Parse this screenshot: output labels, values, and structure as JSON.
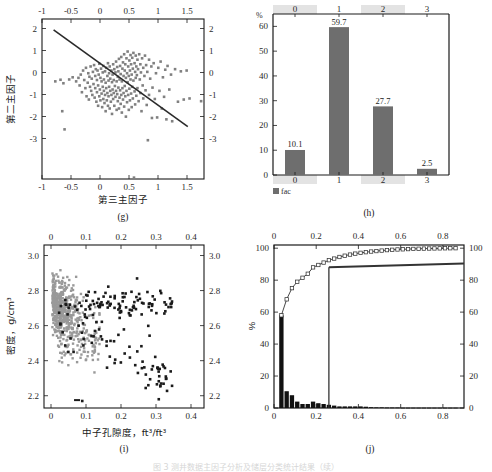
{
  "figure": {
    "bottom_caption": "图 3 测井数据主因子分析及储层分类统计结果（续）"
  },
  "panels": {
    "g": {
      "label": "(g)",
      "xlabel": "第三主因子",
      "ylabel": "第二主因子",
      "xticks": [
        "-1",
        "-0.5",
        "0",
        "0.5",
        "1",
        "1.5"
      ],
      "yticks": [
        "2",
        "1",
        "0",
        "-1",
        "-2",
        "-3"
      ],
      "point_color": "#808080",
      "line_color": "#2a2a2a"
    },
    "h": {
      "label": "(h)",
      "ylabel": "%",
      "legend": "fac",
      "bar_color": "#6e6e6e",
      "xticks": [
        "0",
        "1",
        "2",
        "3"
      ],
      "yticks": [
        "0",
        "10",
        "20",
        "30",
        "40",
        "50",
        "60"
      ],
      "top_xticks": [
        "0",
        "1",
        "2",
        "3"
      ]
    },
    "i": {
      "label": "(i)",
      "xlabel": "中子孔隙度，ft³/ft³",
      "ylabel": "密度，g/cm³",
      "xticks": [
        "0",
        "0.1",
        "0.2",
        "0.3",
        "0.4"
      ],
      "yticks": [
        "2.2",
        "2.4",
        "2.6",
        "2.8",
        "3.0"
      ],
      "color_a": "#999999",
      "color_b": "#1a1a1a"
    },
    "j": {
      "label": "(j)",
      "ylabel": "%",
      "xticks": [
        "0",
        "0.2",
        "0.4",
        "0.6",
        "0.8"
      ],
      "yticks": [
        "0",
        "20",
        "40",
        "60",
        "80",
        "100"
      ],
      "right_yticks": [
        "0",
        "20",
        "40",
        "60",
        "80",
        "100"
      ],
      "bar_color": "#111111",
      "line_color": "#333333",
      "cutoff_color": "#2a2a2a"
    }
  },
  "chart_data": [
    {
      "type": "scatter",
      "id": "g",
      "title": "(g)",
      "xlabel": "第三主因子",
      "ylabel": "第二主因子",
      "xlim": [
        -1.25,
        1.55
      ],
      "ylim": [
        -3.55,
        2.35
      ],
      "xticks": [
        -1,
        -0.5,
        0,
        0.5,
        1,
        1.5
      ],
      "yticks": [
        2,
        1,
        0,
        -1,
        -2,
        -3
      ],
      "grid": false,
      "marker": "square",
      "marker_color": "#808080",
      "trendline": {
        "x": [
          -1.05,
          1.27
        ],
        "y": [
          1.95,
          -1.62
        ],
        "color": "#2a2a2a"
      },
      "points": [
        [
          -1.02,
          0.05
        ],
        [
          -0.93,
          0.11
        ],
        [
          -0.88,
          -0.02
        ],
        [
          -0.9,
          -1.05
        ],
        [
          -0.86,
          -1.72
        ],
        [
          -0.78,
          0.12
        ],
        [
          -0.72,
          0.2
        ],
        [
          -0.66,
          0.05
        ],
        [
          -0.62,
          0.18
        ],
        [
          -0.6,
          -0.1
        ],
        [
          -0.58,
          0.3
        ],
        [
          -0.56,
          -0.35
        ],
        [
          -0.54,
          0.45
        ],
        [
          -0.52,
          0.1
        ],
        [
          -0.5,
          -0.2
        ],
        [
          -0.49,
          0.55
        ],
        [
          -0.48,
          -0.5
        ],
        [
          -0.46,
          0.0
        ],
        [
          -0.45,
          0.35
        ],
        [
          -0.44,
          -0.62
        ],
        [
          -0.43,
          0.22
        ],
        [
          -0.42,
          -0.15
        ],
        [
          -0.41,
          0.6
        ],
        [
          -0.4,
          -0.3
        ],
        [
          -0.39,
          0.15
        ],
        [
          -0.38,
          -0.45
        ],
        [
          -0.37,
          0.4
        ],
        [
          -0.36,
          -0.05
        ],
        [
          -0.35,
          0.65
        ],
        [
          -0.34,
          -0.55
        ],
        [
          -0.33,
          0.25
        ],
        [
          -0.33,
          -0.2
        ],
        [
          -0.32,
          0.5
        ],
        [
          -0.31,
          -0.7
        ],
        [
          -0.3,
          0.1
        ],
        [
          -0.3,
          -0.35
        ],
        [
          -0.29,
          0.45
        ],
        [
          -0.28,
          -0.1
        ],
        [
          -0.28,
          -0.85
        ],
        [
          -0.27,
          0.3
        ],
        [
          -0.26,
          -0.5
        ],
        [
          -0.26,
          0.7
        ],
        [
          -0.25,
          -0.25
        ],
        [
          -0.24,
          0.18
        ],
        [
          -0.24,
          -0.65
        ],
        [
          -0.23,
          0.52
        ],
        [
          -0.22,
          -0.4
        ],
        [
          -0.22,
          0.05
        ],
        [
          -0.21,
          -0.9
        ],
        [
          -0.2,
          0.38
        ],
        [
          -0.2,
          -0.15
        ],
        [
          -0.19,
          -0.6
        ],
        [
          -0.19,
          0.62
        ],
        [
          -0.18,
          -0.3
        ],
        [
          -0.18,
          0.12
        ],
        [
          -0.17,
          -0.75
        ],
        [
          -0.16,
          0.42
        ],
        [
          -0.16,
          -0.45
        ],
        [
          -0.15,
          0.0
        ],
        [
          -0.15,
          -1.05
        ],
        [
          -0.14,
          0.55
        ],
        [
          -0.14,
          -0.2
        ],
        [
          -0.13,
          -0.65
        ],
        [
          -0.12,
          0.25
        ],
        [
          -0.12,
          -0.38
        ],
        [
          -0.11,
          0.72
        ],
        [
          -0.11,
          -0.85
        ],
        [
          -0.1,
          0.08
        ],
        [
          -0.1,
          -0.5
        ],
        [
          -0.09,
          0.35
        ],
        [
          -0.09,
          -0.15
        ],
        [
          -0.08,
          -0.95
        ],
        [
          -0.08,
          0.6
        ],
        [
          -0.07,
          -0.3
        ],
        [
          -0.07,
          0.15
        ],
        [
          -0.06,
          -0.7
        ],
        [
          -0.05,
          0.45
        ],
        [
          -0.05,
          -0.45
        ],
        [
          -0.04,
          0.02
        ],
        [
          -0.04,
          -1.15
        ],
        [
          -0.03,
          0.3
        ],
        [
          -0.03,
          -0.25
        ],
        [
          -0.02,
          0.68
        ],
        [
          -0.02,
          -0.6
        ],
        [
          -0.01,
          0.1
        ],
        [
          -0.01,
          -0.38
        ],
        [
          0,
          0.5
        ],
        [
          0,
          -0.85
        ],
        [
          0.01,
          -0.12
        ],
        [
          0.02,
          0.38
        ],
        [
          0.02,
          -0.52
        ],
        [
          0.03,
          0.78
        ],
        [
          0.03,
          -0.3
        ],
        [
          0.04,
          0.05
        ],
        [
          0.04,
          -1.0
        ],
        [
          0.05,
          0.58
        ],
        [
          0.05,
          -0.42
        ],
        [
          0.06,
          0.22
        ],
        [
          0.06,
          -0.68
        ],
        [
          0.07,
          0.42
        ],
        [
          0.07,
          -0.18
        ],
        [
          0.08,
          0.88
        ],
        [
          0.08,
          -0.95
        ],
        [
          0.09,
          0.12
        ],
        [
          0.09,
          -0.55
        ],
        [
          0.1,
          0.62
        ],
        [
          0.1,
          -0.28
        ],
        [
          0.11,
          0.32
        ],
        [
          0.11,
          -0.78
        ],
        [
          0.12,
          0.95
        ],
        [
          0.12,
          -0.45
        ],
        [
          0.13,
          0.05
        ],
        [
          0.13,
          -1.1
        ],
        [
          0.14,
          0.52
        ],
        [
          0.14,
          -0.2
        ],
        [
          0.15,
          0.75
        ],
        [
          0.15,
          -0.62
        ],
        [
          0.16,
          0.25
        ],
        [
          0.16,
          -0.38
        ],
        [
          0.17,
          1.05
        ],
        [
          0.17,
          -0.88
        ],
        [
          0.18,
          0.45
        ],
        [
          0.18,
          -0.12
        ],
        [
          0.19,
          0.68
        ],
        [
          0.19,
          -0.5
        ],
        [
          0.2,
          0.18
        ],
        [
          0.2,
          -1.25
        ],
        [
          0.21,
          0.9
        ],
        [
          0.21,
          -0.3
        ],
        [
          0.22,
          0.35
        ],
        [
          0.22,
          -0.72
        ],
        [
          0.23,
          1.15
        ],
        [
          0.23,
          0.02
        ],
        [
          0.24,
          0.6
        ],
        [
          0.24,
          -0.45
        ],
        [
          0.25,
          0.25
        ],
        [
          0.25,
          -1.0
        ],
        [
          0.26,
          0.82
        ],
        [
          0.26,
          -0.22
        ],
        [
          0.27,
          0.45
        ],
        [
          0.27,
          -0.65
        ],
        [
          0.28,
          1.02
        ],
        [
          0.28,
          0.12
        ],
        [
          0.29,
          0.68
        ],
        [
          0.29,
          -0.4
        ],
        [
          0.3,
          0.3
        ],
        [
          0.3,
          -0.9
        ],
        [
          0.31,
          0.92
        ],
        [
          0.31,
          -0.15
        ],
        [
          0.32,
          0.52
        ],
        [
          0.32,
          -0.58
        ],
        [
          0.33,
          1.1
        ],
        [
          0.33,
          0.08
        ],
        [
          0.34,
          -3.5
        ],
        [
          0.35,
          0.72
        ],
        [
          0.35,
          -0.32
        ],
        [
          0.36,
          0.4
        ],
        [
          0.36,
          -0.8
        ],
        [
          0.37,
          1.0
        ],
        [
          0.37,
          0.18
        ],
        [
          0.38,
          0.6
        ],
        [
          0.38,
          -0.48
        ],
        [
          0.39,
          0.28
        ],
        [
          0.4,
          0.85
        ],
        [
          0.4,
          -0.2
        ],
        [
          0.41,
          0.5
        ],
        [
          0.42,
          -0.68
        ],
        [
          0.43,
          1.05
        ],
        [
          0.44,
          0.12
        ],
        [
          0.45,
          0.68
        ],
        [
          0.45,
          -0.38
        ],
        [
          0.46,
          0.38
        ],
        [
          0.47,
          -1.05
        ],
        [
          0.48,
          0.9
        ],
        [
          0.49,
          -0.1
        ],
        [
          0.5,
          0.55
        ],
        [
          0.5,
          -0.58
        ],
        [
          0.52,
          0.25
        ],
        [
          0.53,
          1.0
        ],
        [
          0.54,
          -0.28
        ],
        [
          0.55,
          0.65
        ],
        [
          0.56,
          -0.82
        ],
        [
          0.57,
          0.4
        ],
        [
          0.58,
          -2.12
        ],
        [
          0.6,
          0.85
        ],
        [
          0.6,
          -0.45
        ],
        [
          0.62,
          0.15
        ],
        [
          0.64,
          0.6
        ],
        [
          0.65,
          -1.3
        ],
        [
          0.66,
          -0.18
        ],
        [
          0.68,
          0.72
        ],
        [
          0.7,
          -0.6
        ],
        [
          0.72,
          0.35
        ],
        [
          0.74,
          -1.28
        ],
        [
          0.76,
          0.55
        ],
        [
          0.78,
          -0.3
        ],
        [
          0.8,
          0.78
        ],
        [
          0.82,
          -0.95
        ],
        [
          0.84,
          0.2
        ],
        [
          0.86,
          -0.52
        ],
        [
          0.88,
          0.48
        ],
        [
          0.9,
          -1.35
        ],
        [
          0.92,
          0.62
        ],
        [
          0.95,
          -0.25
        ],
        [
          0.98,
          0.3
        ],
        [
          1.0,
          -1.42
        ],
        [
          1.05,
          0.5
        ],
        [
          1.1,
          -0.7
        ],
        [
          1.15,
          0.42
        ],
        [
          1.2,
          -0.62
        ],
        [
          1.25,
          0.45
        ],
        [
          1.3,
          -0.58
        ],
        [
          1.5,
          -0.68
        ]
      ]
    },
    {
      "type": "bar",
      "id": "h",
      "title": "(h)",
      "categories": [
        "0",
        "1",
        "2",
        "3"
      ],
      "values": [
        10.1,
        59.7,
        27.7,
        2.5
      ],
      "value_labels": [
        "10.1",
        "59.7",
        "27.7",
        "2.5"
      ],
      "ylabel": "%",
      "xlabel": "",
      "ylim": [
        0,
        65
      ],
      "yticks": [
        0,
        10,
        20,
        30,
        40,
        50,
        60
      ],
      "legend": [
        "fac"
      ],
      "legend_position": "bottom-left",
      "bar_color": "#6e6e6e",
      "grid": false
    },
    {
      "type": "scatter",
      "id": "i",
      "title": "(i)",
      "xlabel": "中子孔隙度，ft³/ft³",
      "ylabel": "密度，g/cm³",
      "xlim": [
        -0.02,
        0.44
      ],
      "ylim": [
        3.06,
        2.13
      ],
      "y_inverted": true,
      "xticks": [
        0,
        0.1,
        0.2,
        0.3,
        0.4
      ],
      "yticks": [
        2.2,
        2.4,
        2.6,
        2.8,
        3.0
      ],
      "grid": false,
      "series": [
        {
          "name": "cluster-gray",
          "color": "#999999"
        },
        {
          "name": "cluster-black",
          "color": "#1a1a1a"
        }
      ]
    },
    {
      "type": "bar",
      "id": "j",
      "title": "(j)",
      "subtype": "pareto",
      "ylabel": "%",
      "xlabel": "",
      "xlim": [
        0.0,
        0.9
      ],
      "ylim": [
        0,
        102
      ],
      "xticks": [
        0,
        0.2,
        0.4,
        0.6,
        0.8
      ],
      "yticks": [
        0,
        20,
        40,
        60,
        80,
        100
      ],
      "bin_centers": [
        0.035,
        0.06,
        0.085,
        0.11,
        0.135,
        0.16,
        0.185,
        0.21,
        0.235,
        0.26,
        0.285,
        0.31,
        0.335,
        0.36,
        0.385,
        0.41,
        0.435,
        0.46,
        0.485,
        0.51,
        0.535,
        0.56,
        0.585,
        0.61,
        0.635,
        0.66,
        0.685,
        0.71,
        0.735,
        0.76,
        0.785,
        0.81,
        0.835,
        0.86
      ],
      "frequencies": [
        58,
        10.5,
        8,
        4,
        2.5,
        2.5,
        4,
        3,
        2.5,
        2,
        1.5,
        1,
        1,
        1,
        1,
        1,
        0.8,
        0.5,
        0.4,
        0.4,
        0.3,
        0.3,
        0.3,
        0.2,
        0.2,
        0.2,
        0.2,
        0.2,
        0.2,
        0.2,
        0.2,
        0.2,
        0.2,
        0.2
      ],
      "cumulative": [
        58,
        68,
        75,
        79,
        81.5,
        84,
        88,
        89.5,
        91,
        92.5,
        93.5,
        94.5,
        95.3,
        96,
        96.6,
        97.1,
        97.5,
        97.9,
        98.2,
        98.5,
        98.8,
        99,
        99.2,
        99.3,
        99.45,
        99.55,
        99.65,
        99.75,
        99.8,
        99.85,
        99.9,
        99.95,
        99.98,
        100
      ],
      "cutoff_x": 0.26,
      "cutoff_y": 88,
      "bar_color": "#111111",
      "line_color": "#333333",
      "marker": "open-square",
      "grid": false
    }
  ]
}
